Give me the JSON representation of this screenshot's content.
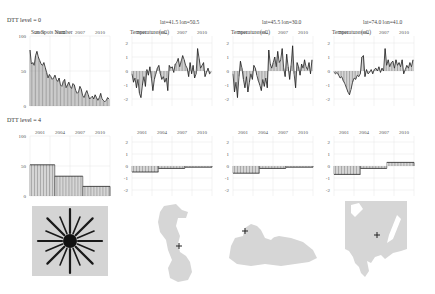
{
  "rows": [
    {
      "label": "DTT level = 0"
    },
    {
      "label": "DTT level = 4"
    }
  ],
  "columns": [
    {
      "header": "",
      "ylabel": "Sun Spots Number"
    },
    {
      "header": "lat=41.5  lon=50.5",
      "ylabel": "Temperature (oC)"
    },
    {
      "header": "lat=45.5  lon=30.0",
      "ylabel": "Temperature (oC)"
    },
    {
      "header": "lat=74.0  lon=41.0",
      "ylabel": "Temperature (oC)"
    }
  ],
  "maps": [
    {
      "name": "sunspot-icon"
    },
    {
      "name": "caspian-sea-map"
    },
    {
      "name": "black-sea-map"
    },
    {
      "name": "white-sea-map"
    }
  ],
  "chart_data": [
    {
      "type": "area",
      "title": "Sun Spots Number",
      "row": "DTT level = 0",
      "x_ticks": [
        "2001",
        "2004",
        "2007",
        "2010"
      ],
      "y_ticks": [
        "100",
        "50",
        "0"
      ],
      "ylim": [
        0,
        100
      ],
      "values": [
        80,
        60,
        62,
        58,
        72,
        78,
        70,
        65,
        60,
        58,
        62,
        55,
        48,
        40,
        45,
        42,
        38,
        40,
        44,
        38,
        35,
        40,
        30,
        28,
        35,
        38,
        26,
        30,
        34,
        28,
        25,
        32,
        30,
        22,
        18,
        20,
        28,
        24,
        15,
        12,
        18,
        22,
        16,
        10,
        12,
        14,
        10,
        16,
        12,
        8,
        12,
        18,
        10,
        8,
        6,
        8,
        12,
        10
      ]
    },
    {
      "type": "area",
      "title": "Temperature (oC) lat=41.5 lon=50.5",
      "row": "DTT level = 0",
      "x_ticks": [
        "2001",
        "2004",
        "2007",
        "2010"
      ],
      "y_ticks": [
        "2",
        "1",
        "0",
        "-1",
        "-2"
      ],
      "ylim": [
        -2.5,
        2.5
      ],
      "values": [
        -0.2,
        -0.8,
        -0.5,
        -1.2,
        -0.6,
        -1.6,
        -1.9,
        -1.0,
        -0.4,
        -1.1,
        0.1,
        -0.3,
        0.3,
        -0.5,
        -1.4,
        -0.6,
        -0.2,
        0.2,
        0.4,
        -0.2,
        -0.6,
        -0.4,
        -0.8,
        -0.5,
        -1.4,
        0.4,
        0.2,
        0.3,
        -0.1,
        0.5,
        0.6,
        0.9,
        0.3,
        0.7,
        1.1,
        0.8,
        0.4,
        0.2,
        -0.4,
        0.6,
        -0.2,
        0.4,
        -0.5,
        -0.2,
        1.6,
        0.9,
        0.2,
        0.4,
        0.6,
        -0.4,
        -0.1,
        0.2,
        -0.2,
        -0.1
      ]
    },
    {
      "type": "area",
      "title": "Temperature (oC) lat=45.5 lon=30.0",
      "row": "DTT level = 0",
      "x_ticks": [
        "2001",
        "2004",
        "2007",
        "2010"
      ],
      "y_ticks": [
        "2",
        "1",
        "0",
        "-1",
        "-2"
      ],
      "ylim": [
        -2.5,
        2.5
      ],
      "values": [
        -0.2,
        -1.5,
        -0.8,
        -1.9,
        -0.4,
        0.7,
        0.2,
        -0.6,
        -1.2,
        -0.4,
        -1.5,
        -0.8,
        -0.2,
        -0.6,
        0.4,
        0.2,
        -0.3,
        -0.7,
        -1.0,
        -1.4,
        -0.6,
        -1.1,
        -0.5,
        -1.2,
        1.5,
        0.5,
        0.2,
        0.6,
        1.0,
        0.3,
        1.4,
        0.6,
        0.8,
        1.6,
        0.2,
        -0.4,
        1.2,
        0.3,
        -0.6,
        0.4,
        1.8,
        -0.2,
        -1.2,
        0.6,
        0.3,
        -0.3,
        0.5,
        0.2,
        0.8,
        0.3,
        0.1,
        0.6,
        -0.2,
        0.8
      ]
    },
    {
      "type": "area",
      "title": "Temperature (oC) lat=74.0 lon=41.0",
      "row": "DTT level = 0",
      "x_ticks": [
        "2001",
        "2004",
        "2007",
        "2010"
      ],
      "y_ticks": [
        "2",
        "1",
        "0",
        "-1",
        "-2"
      ],
      "ylim": [
        -2.5,
        2.5
      ],
      "values": [
        -0.1,
        -0.2,
        -0.1,
        -0.3,
        -0.5,
        -0.4,
        -0.7,
        -0.9,
        -1.2,
        -1.5,
        -1.7,
        -1.3,
        -0.8,
        -0.5,
        -0.6,
        -0.3,
        -0.4,
        -0.2,
        1.0,
        1.1,
        -0.4,
        0.1,
        -0.2,
        -0.1,
        0.1,
        -0.2,
        0.1,
        0.2,
        0.0,
        0.3,
        -0.1,
        0.2,
        0.0,
        1.6,
        0.4,
        0.8,
        0.3,
        0.6,
        0.7,
        0.2,
        0.8,
        0.4,
        0.6,
        0.3,
        0.8,
        -0.2,
        0.1,
        0.4,
        0.2,
        0.6,
        0.3,
        0.8
      ]
    },
    {
      "type": "area",
      "title": "Sun Spots Number",
      "row": "DTT level = 4",
      "x_ticks": [
        "2001",
        "2004",
        "2007",
        "2010"
      ],
      "y_ticks": [
        "100",
        "50",
        "0"
      ],
      "ylim": [
        0,
        100
      ],
      "steps": [
        {
          "x0": 0,
          "x1": 0.31,
          "y": 52
        },
        {
          "x0": 0.31,
          "x1": 0.66,
          "y": 33
        },
        {
          "x0": 0.66,
          "x1": 1,
          "y": 16
        }
      ]
    },
    {
      "type": "area",
      "title": "Temperature (oC) lat=41.5 lon=50.5",
      "row": "DTT level = 4",
      "x_ticks": [
        "2001",
        "2004",
        "2007",
        "2010"
      ],
      "y_ticks": [
        "2",
        "1",
        "0",
        "-1",
        "-2"
      ],
      "ylim": [
        -2.5,
        2.5
      ],
      "steps": [
        {
          "x0": 0,
          "x1": 0.33,
          "y": -0.5
        },
        {
          "x0": 0.33,
          "x1": 0.66,
          "y": -0.2
        },
        {
          "x0": 0.66,
          "x1": 1,
          "y": -0.1
        }
      ]
    },
    {
      "type": "area",
      "title": "Temperature (oC) lat=45.5 lon=30.0",
      "row": "DTT level = 4",
      "x_ticks": [
        "2001",
        "2004",
        "2007",
        "2010"
      ],
      "y_ticks": [
        "2",
        "1",
        "0",
        "-1",
        "-2"
      ],
      "ylim": [
        -2.5,
        2.5
      ],
      "steps": [
        {
          "x0": 0,
          "x1": 0.33,
          "y": -0.6
        },
        {
          "x0": 0.33,
          "x1": 0.66,
          "y": -0.2
        },
        {
          "x0": 0.66,
          "x1": 1,
          "y": -0.1
        }
      ]
    },
    {
      "type": "area",
      "title": "Temperature (oC) lat=74.0 lon=41.0",
      "row": "DTT level = 4",
      "x_ticks": [
        "2001",
        "2004",
        "2007",
        "2010"
      ],
      "y_ticks": [
        "2",
        "1",
        "0",
        "-1",
        "-2"
      ],
      "ylim": [
        -2.5,
        2.5
      ],
      "steps": [
        {
          "x0": 0,
          "x1": 0.33,
          "y": -0.7
        },
        {
          "x0": 0.33,
          "x1": 0.66,
          "y": -0.2
        },
        {
          "x0": 0.66,
          "x1": 1,
          "y": 0.3
        }
      ]
    }
  ]
}
